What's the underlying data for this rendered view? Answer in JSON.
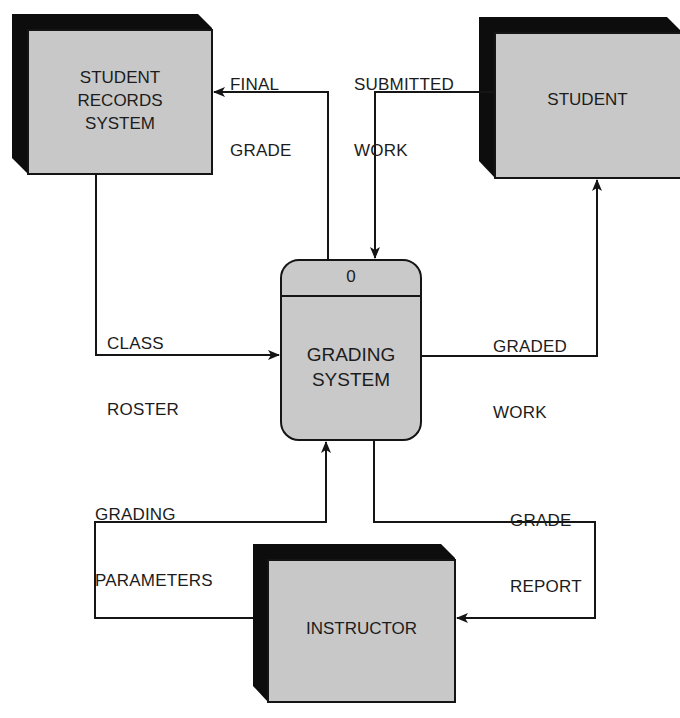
{
  "diagram": {
    "type": "context data flow diagram",
    "process": {
      "id": "0",
      "name_line1": "GRADING",
      "name_line2": "SYSTEM"
    },
    "entities": {
      "student_records": {
        "line1": "STUDENT",
        "line2": "RECORDS",
        "line3": "SYSTEM"
      },
      "student": {
        "line1": "STUDENT"
      },
      "instructor": {
        "line1": "INSTRUCTOR"
      }
    },
    "flows": {
      "final_grade": {
        "line1": "FINAL",
        "line2": "GRADE",
        "from": "GRADING SYSTEM",
        "to": "STUDENT RECORDS SYSTEM"
      },
      "submitted_work": {
        "line1": "SUBMITTED",
        "line2": "WORK",
        "from": "STUDENT",
        "to": "GRADING SYSTEM"
      },
      "class_roster": {
        "line1": "CLASS",
        "line2": "ROSTER",
        "from": "STUDENT RECORDS SYSTEM",
        "to": "GRADING SYSTEM"
      },
      "graded_work": {
        "line1": "GRADED",
        "line2": "WORK",
        "from": "GRADING SYSTEM",
        "to": "STUDENT"
      },
      "grading_parameters": {
        "line1": "GRADING",
        "line2": "PARAMETERS",
        "from": "INSTRUCTOR",
        "to": "GRADING SYSTEM"
      },
      "grade_report": {
        "line1": "GRADE",
        "line2": "REPORT",
        "from": "GRADING SYSTEM",
        "to": "INSTRUCTOR"
      }
    },
    "colors": {
      "entity_fill": "#c8c8c8",
      "entity_shadow": "#0d0d0d",
      "process_fill": "#c9c9c9",
      "line": "#151515"
    }
  }
}
